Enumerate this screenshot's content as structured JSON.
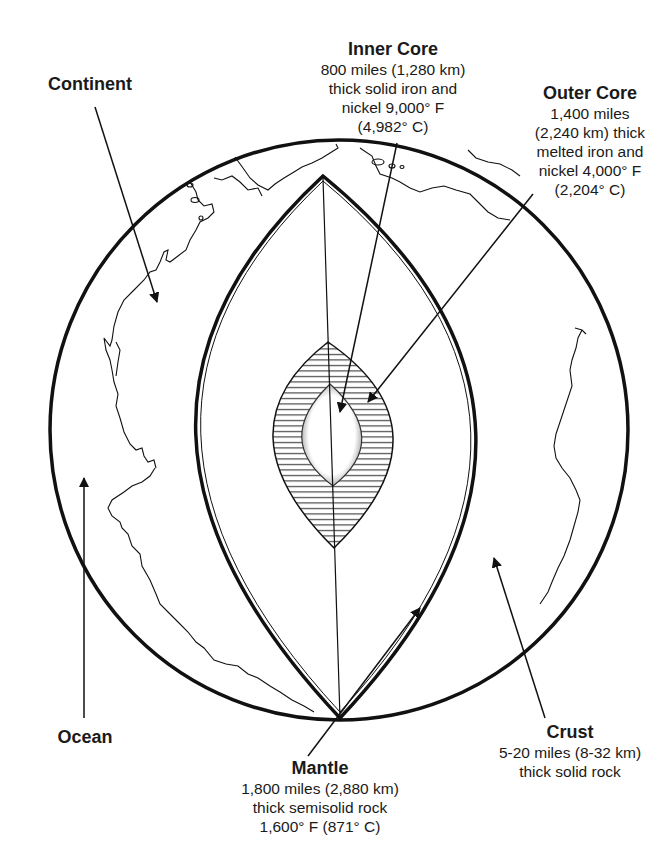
{
  "diagram": {
    "colors": {
      "ink": "#111111",
      "background": "#ffffff",
      "hatch": "#222222"
    },
    "labels": {
      "inner_core": {
        "title": "Inner Core",
        "lines": [
          "800 miles (1,280 km)",
          "thick solid iron and",
          "nickel 9,000° F",
          "(4,982° C)"
        ]
      },
      "outer_core": {
        "title": "Outer Core",
        "lines": [
          "1,400 miles",
          "(2,240 km) thick",
          "melted iron and",
          "nickel 4,000° F",
          "(2,204° C)"
        ]
      },
      "continent": {
        "title": "Continent"
      },
      "ocean": {
        "title": "Ocean"
      },
      "mantle": {
        "title": "Mantle",
        "lines": [
          "1,800 miles (2,880 km)",
          "thick semisolid rock",
          "1,600° F (871° C)"
        ]
      },
      "crust": {
        "title": "Crust",
        "lines": [
          "5-20 miles (8-32 km)",
          "thick solid rock"
        ]
      }
    }
  }
}
